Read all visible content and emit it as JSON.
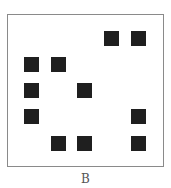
{
  "figure": {
    "label": "B",
    "grid": {
      "rows": 5,
      "cols": 5,
      "filled_color": "#1f1f1f",
      "border_color": "#8a8a8a",
      "filled_cells": [
        {
          "row": 0,
          "col": 3
        },
        {
          "row": 0,
          "col": 4
        },
        {
          "row": 1,
          "col": 0
        },
        {
          "row": 1,
          "col": 1
        },
        {
          "row": 2,
          "col": 0
        },
        {
          "row": 2,
          "col": 2
        },
        {
          "row": 3,
          "col": 0
        },
        {
          "row": 3,
          "col": 4
        },
        {
          "row": 4,
          "col": 1
        },
        {
          "row": 4,
          "col": 2
        },
        {
          "row": 4,
          "col": 4
        }
      ]
    }
  }
}
